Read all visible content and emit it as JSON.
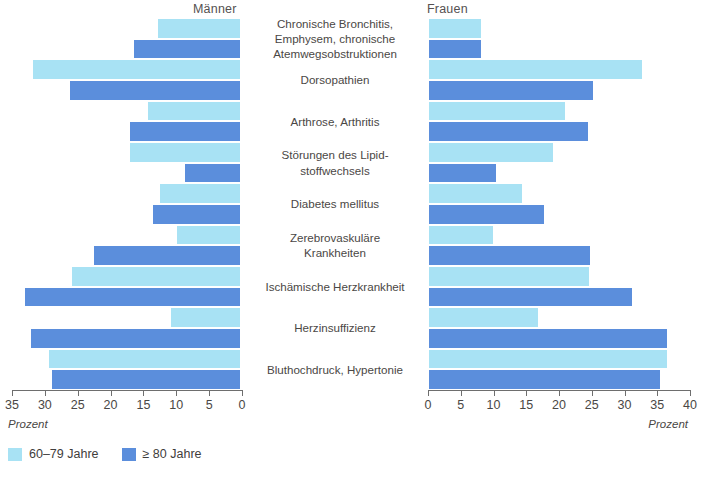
{
  "header": {
    "left_group": "Männer",
    "right_group": "Frauen"
  },
  "axis": {
    "unit_left": "Prozent",
    "unit_right": "Prozent",
    "left_ticks": [
      "35",
      "30",
      "25",
      "20",
      "15",
      "10",
      "5",
      "0"
    ],
    "right_ticks": [
      "0",
      "5",
      "10",
      "15",
      "20",
      "25",
      "30",
      "35",
      "40"
    ]
  },
  "legend": {
    "items": [
      {
        "label": "60–79 Jahre",
        "color": "#a8e2f4"
      },
      {
        "label": "≥ 80 Jahre",
        "color": "#5b8edc"
      }
    ]
  },
  "colors": {
    "age_60_79": "#a8e2f4",
    "age_80_plus": "#5b8edc",
    "axis": "#6e6e6e",
    "text": "#4a4745"
  },
  "chart_data": {
    "type": "bar",
    "title": "",
    "subtype": "diverging-population-pyramid",
    "xlabel": "Prozent",
    "ylabel": "",
    "left_group": "Männer",
    "right_group": "Frauen",
    "left_xlim": [
      0,
      35.5
    ],
    "right_xlim": [
      0,
      40.5
    ],
    "left_axis_direction": "reversed",
    "grid": false,
    "legend_position": "bottom-left",
    "categories": [
      "Chronische Bronchitis, Emphysem, chronische Atemwegsobstruktionen",
      "Dorsopathien",
      "Arthrose, Arthritis",
      "Störungen des Lipidstoffwechsels",
      "Diabetes mellitus",
      "Zerebrovaskuläre Krankheiten",
      "Ischämische Herzkrankheit",
      "Herzinsuffizienz",
      "Bluthochdruck, Hypertonie"
    ],
    "series": [
      {
        "name": "Männer 60–79 Jahre",
        "side": "left",
        "age": "60-79",
        "values": [
          12.8,
          32.3,
          14.3,
          17.2,
          12.5,
          9.8,
          26.2,
          10.8,
          29.7
        ]
      },
      {
        "name": "Männer ≥ 80 Jahre",
        "side": "left",
        "age": "80+",
        "values": [
          16.5,
          26.5,
          17.2,
          8.5,
          13.5,
          22.8,
          33.5,
          32.6,
          29.2
        ]
      },
      {
        "name": "Frauen 60–79 Jahre",
        "side": "right",
        "age": "60-79",
        "values": [
          8.2,
          33.4,
          21.4,
          19.4,
          14.6,
          10.0,
          25.1,
          17.1,
          37.4
        ]
      },
      {
        "name": "Frauen ≥ 80 Jahre",
        "side": "right",
        "age": "80+",
        "values": [
          8.2,
          25.8,
          24.9,
          10.5,
          18.0,
          25.2,
          31.8,
          37.4,
          36.3
        ]
      }
    ]
  },
  "rows": [
    {
      "label": "Chronische Bronchitis,\nEmphysem, chronische\nAtemwegsobstruktionen",
      "left_light": 12.8,
      "left_dark": 16.5,
      "right_light": 8.2,
      "right_dark": 8.2
    },
    {
      "label": "Dorsopathien",
      "left_light": 32.3,
      "left_dark": 26.5,
      "right_light": 33.4,
      "right_dark": 25.8
    },
    {
      "label": "Arthrose, Arthritis",
      "left_light": 14.3,
      "left_dark": 17.2,
      "right_light": 21.4,
      "right_dark": 24.9
    },
    {
      "label": "Störungen des Lipid-\nstoffwechsels",
      "left_light": 17.2,
      "left_dark": 8.5,
      "right_light": 19.4,
      "right_dark": 10.5
    },
    {
      "label": "Diabetes mellitus",
      "left_light": 12.5,
      "left_dark": 13.5,
      "right_light": 14.6,
      "right_dark": 18.0
    },
    {
      "label": "Zerebrovaskuläre\nKrankheiten",
      "left_light": 9.8,
      "left_dark": 22.8,
      "right_light": 10.0,
      "right_dark": 25.2
    },
    {
      "label": "Ischämische Herzkrankheit",
      "left_light": 26.2,
      "left_dark": 33.5,
      "right_light": 25.1,
      "right_dark": 31.8
    },
    {
      "label": "Herzinsuffizienz",
      "left_light": 10.8,
      "left_dark": 32.6,
      "right_light": 17.1,
      "right_dark": 37.4
    },
    {
      "label": "Bluthochdruck, Hypertonie",
      "left_light": 29.7,
      "left_dark": 29.2,
      "right_light": 37.4,
      "right_dark": 36.3
    }
  ]
}
